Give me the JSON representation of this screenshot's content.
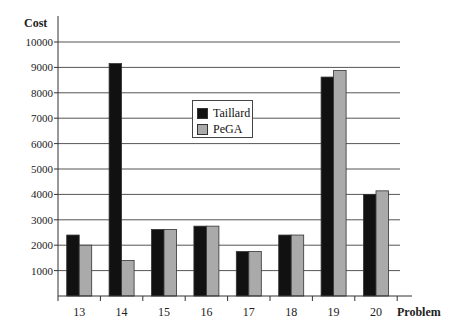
{
  "chart_data": {
    "type": "bar",
    "title": "",
    "xlabel": "Problem",
    "ylabel": "Cost",
    "ylim": [
      0,
      10000
    ],
    "yticks": [
      1000,
      2000,
      3000,
      4000,
      5000,
      6000,
      7000,
      8000,
      9000,
      10000
    ],
    "grid": true,
    "legend_position": "upper center (inside plot)",
    "categories": [
      "13",
      "14",
      "15",
      "16",
      "17",
      "18",
      "19",
      "20"
    ],
    "series": [
      {
        "name": "Taillard",
        "color": "#111111",
        "values": [
          2400,
          9150,
          2620,
          2750,
          1750,
          2400,
          8620,
          4000
        ]
      },
      {
        "name": "PeGA",
        "color": "#aaaaaa",
        "values": [
          2000,
          1400,
          2620,
          2750,
          1750,
          2400,
          8880,
          4140
        ]
      }
    ]
  },
  "labels": {
    "y_axis": "Cost",
    "x_axis": "Problem",
    "legend": [
      "Taillard",
      "PeGA"
    ]
  }
}
